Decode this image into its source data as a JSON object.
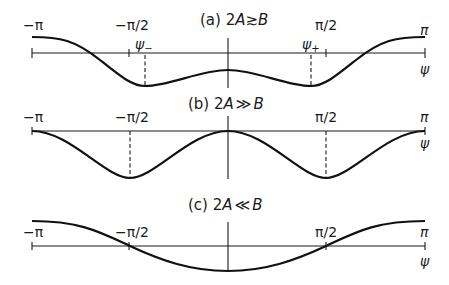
{
  "panels": [
    {
      "id": "a",
      "title_prefix": "(a) 2",
      "title_A": "A",
      "title_rel": "≳",
      "title_B": "B",
      "ticks": {
        "neg_pi": "−π",
        "neg_half_pi": "−π/2",
        "half_pi": "π/2",
        "pi": "π"
      },
      "markers": {
        "psi_minus": "ψ",
        "psi_minus_sub": "−",
        "psi_plus": "ψ",
        "psi_plus_sub": "+"
      },
      "axis_label": "ψ"
    },
    {
      "id": "b",
      "title_prefix": "(b) 2",
      "title_A": "A",
      "title_rel": "≫",
      "title_B": "B",
      "ticks": {
        "neg_pi": "−π",
        "neg_half_pi": "−π/2",
        "half_pi": "π/2",
        "pi": "π"
      },
      "axis_label": "ψ"
    },
    {
      "id": "c",
      "title_prefix": "(c) 2",
      "title_A": "A",
      "title_rel": "≪",
      "title_B": "B",
      "ticks": {
        "neg_pi": "−π",
        "neg_half_pi": "−π/2",
        "half_pi": "π/2",
        "pi": "π"
      },
      "axis_label": "ψ"
    }
  ],
  "colors": {
    "line": "#111111",
    "background": "#ffffff"
  }
}
